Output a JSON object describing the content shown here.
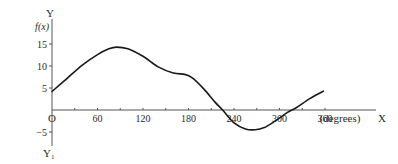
{
  "chart_data": {
    "type": "line",
    "title": "",
    "xlabel": "(degrees)",
    "x_axis_letter": "X",
    "ylabel": "f(x)",
    "y_axis_letter": "Y",
    "y_axis_bottom_letter": "Y₁",
    "origin_label": "O",
    "xlim": [
      0,
      360
    ],
    "ylim": [
      -7,
      20
    ],
    "grid": false,
    "legend": null,
    "x_ticks": [
      0,
      30,
      60,
      90,
      120,
      150,
      180,
      210,
      240,
      270,
      300,
      330,
      360
    ],
    "x_tick_labels": [
      "60",
      "120",
      "180",
      "240",
      "300",
      "360"
    ],
    "x_tick_label_values": [
      60,
      120,
      180,
      240,
      300,
      360
    ],
    "y_ticks": [
      -5,
      5,
      10,
      15
    ],
    "y_tick_labels": [
      "−5",
      "5",
      "10",
      "15"
    ],
    "series": [
      {
        "name": "f(x)",
        "color": "#1a1a1a",
        "x": [
          0,
          20,
          40,
          60,
          75,
          85,
          100,
          120,
          140,
          160,
          175,
          185,
          200,
          215,
          225,
          240,
          255,
          268,
          280,
          295,
          310,
          322,
          340,
          358
        ],
        "y": [
          4.2,
          7.2,
          10.2,
          12.6,
          13.9,
          14.3,
          13.9,
          12.2,
          9.8,
          8.4,
          8.1,
          7.3,
          4.8,
          1.8,
          0.0,
          -2.9,
          -4.3,
          -4.5,
          -4.0,
          -2.4,
          -0.6,
          0.5,
          2.6,
          4.3
        ]
      }
    ]
  }
}
